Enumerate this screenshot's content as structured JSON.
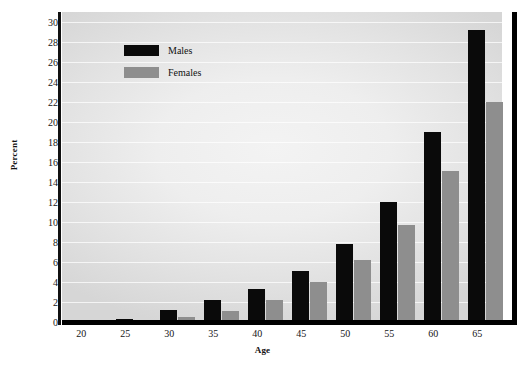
{
  "chart_data": {
    "type": "bar",
    "title": "",
    "subtitle": "",
    "xlabel": "Age",
    "ylabel": "Percent",
    "categories": [
      "20",
      "25",
      "30",
      "35",
      "40",
      "45",
      "50",
      "55",
      "60",
      "65"
    ],
    "series": [
      {
        "name": "Males",
        "color": "#0a0a0a",
        "values": [
          0.05,
          0.3,
          1.2,
          2.2,
          3.3,
          5.1,
          7.8,
          12.0,
          19.0,
          29.2
        ]
      },
      {
        "name": "Females",
        "color": "#8e8e8e",
        "values": [
          0.05,
          0.05,
          0.5,
          1.1,
          2.2,
          4.0,
          6.2,
          9.7,
          15.1,
          22.0
        ]
      }
    ],
    "ylim": [
      0,
      31
    ],
    "xlim_categories": true,
    "yticks": [
      0,
      2,
      4,
      6,
      8,
      10,
      12,
      14,
      16,
      18,
      20,
      22,
      24,
      26,
      28,
      30
    ],
    "ytick_labels": [
      "0",
      "2",
      "4",
      "6",
      "8",
      "10",
      "12",
      "14",
      "16",
      "18",
      "20",
      "22",
      "24",
      "26",
      "28",
      "30"
    ],
    "xticks": [
      "20",
      "25",
      "30",
      "35",
      "40",
      "45",
      "50",
      "55",
      "60",
      "65"
    ],
    "grid": true,
    "grid_axis": "y",
    "grid_color": "#ffffff",
    "legend_position": "upper-left-inside",
    "plot_background": "#ededed",
    "axis_color": "#000000"
  },
  "legend": {
    "entries": [
      {
        "label": "Males",
        "color": "#0a0a0a"
      },
      {
        "label": "Females",
        "color": "#8e8e8e"
      }
    ]
  }
}
